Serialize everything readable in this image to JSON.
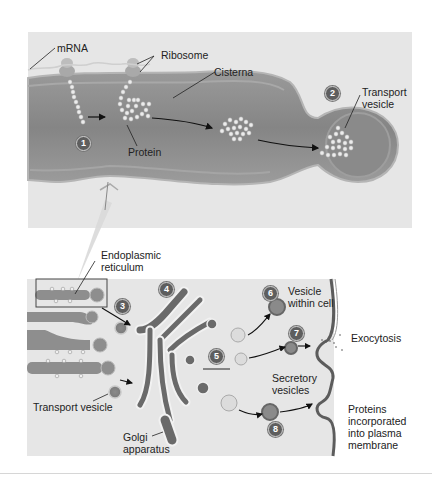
{
  "figure": {
    "top_panel": {
      "labels": {
        "mrna": "mRNA",
        "ribosome": "Ribosome",
        "cisterna": "Cisterna",
        "protein": "Protein",
        "transport_vesicle": "Transport\nvesicle"
      },
      "steps": [
        "1",
        "2"
      ]
    },
    "bottom_panel": {
      "labels": {
        "endoplasmic_reticulum": "Endoplasmic\nreticulum",
        "transport_vesicle": "Transport vesicle",
        "golgi_apparatus": "Golgi\napparatus",
        "vesicle_within_cell": "Vesicle\nwithin cell",
        "exocytosis": "Exocytosis",
        "secretory_vesicles": "Secretory\nvesicles",
        "proteins_incorporated": "Proteins\nincorporated\ninto plasma\nmembrane"
      },
      "steps": [
        "3",
        "4",
        "5",
        "6",
        "7",
        "8"
      ]
    },
    "colors": {
      "panel_bg": "#e6e6e6",
      "er_fill": "#8e8e8e",
      "er_dark": "#6e6e6e",
      "membrane": "#5a5a5a",
      "badge": "#5e5e5e",
      "bead": "#e8e8e8"
    }
  }
}
